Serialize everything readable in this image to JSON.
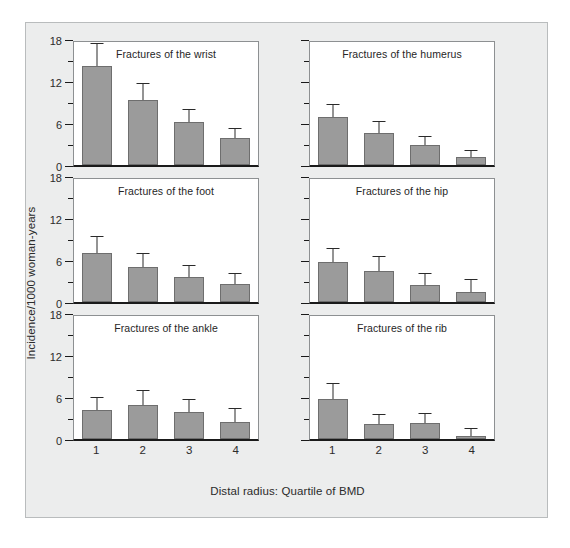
{
  "chart_data": {
    "type": "bar",
    "title": "",
    "xlabel": "Distal radius: Quartile of BMD",
    "ylabel": "Incidence/1000 woman-years",
    "categories": [
      "1",
      "2",
      "3",
      "4"
    ],
    "ylim": [
      0,
      18
    ],
    "ytick_labels": [
      "0",
      "6",
      "12",
      "18"
    ],
    "ytick_values": [
      0,
      6,
      12,
      18
    ],
    "minor_tick_interval": 3,
    "grid": false,
    "legend": null,
    "bar_color": "#9b9b9b",
    "error_bars": "upper-only",
    "panel_layout": "3 rows x 2 columns",
    "panels": [
      {
        "title": "Fractures of the wrist",
        "values": [
          14.2,
          9.3,
          6.2,
          3.9
        ],
        "error_upper": [
          17.3,
          11.6,
          7.9,
          5.2
        ]
      },
      {
        "title": "Fractures of the humerus",
        "values": [
          6.8,
          4.6,
          2.8,
          1.1
        ],
        "error_upper": [
          8.6,
          6.2,
          4.0,
          2.0
        ]
      },
      {
        "title": "Fractures of the foot",
        "values": [
          7.0,
          5.0,
          3.6,
          2.6
        ],
        "error_upper": [
          9.3,
          6.9,
          5.2,
          4.0
        ]
      },
      {
        "title": "Fractures of the hip",
        "values": [
          5.7,
          4.5,
          2.5,
          1.5
        ],
        "error_upper": [
          7.6,
          6.4,
          4.0,
          3.2
        ]
      },
      {
        "title": "Fractures of the ankle",
        "values": [
          4.1,
          4.9,
          3.9,
          2.4
        ],
        "error_upper": [
          5.8,
          6.8,
          5.6,
          4.3
        ]
      },
      {
        "title": "Fractures of the rib",
        "values": [
          5.7,
          2.2,
          2.3,
          0.4
        ],
        "error_upper": [
          7.8,
          3.5,
          3.6,
          1.5
        ]
      }
    ]
  }
}
